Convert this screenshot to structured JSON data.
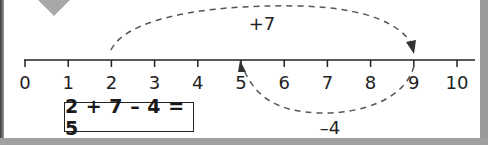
{
  "diagram": {
    "type": "number_line",
    "range": [
      0,
      10
    ],
    "tick_labels": [
      "0",
      "1",
      "2",
      "3",
      "4",
      "5",
      "6",
      "7",
      "8",
      "9",
      "10"
    ],
    "jumps": [
      {
        "from": 2,
        "to": 9,
        "label": "+7",
        "position": "above"
      },
      {
        "from": 9,
        "to": 5,
        "label": "–4",
        "position": "below"
      }
    ],
    "equation": "2 + 7 – 4 = 5",
    "colors": {
      "line": "#222222",
      "arc": "#555555",
      "border": "#9a9a9a"
    }
  }
}
